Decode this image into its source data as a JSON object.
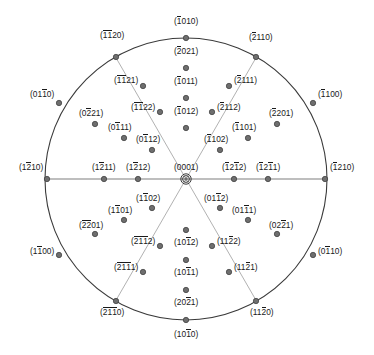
{
  "figure": {
    "type": "stereographic-projection",
    "lattice": "hexagonal",
    "notation": "Miller-Bravais (hkil)",
    "center": {
      "cx": 186,
      "cy": 179,
      "r": 141
    },
    "colors": {
      "background": "#ffffff",
      "circle_stroke": "#3a3a3a",
      "sector_stroke": "#a8a8a8",
      "axis_stroke": "#a8a8a8",
      "pole_fill": "#6e6e6e",
      "pole_stroke": "#3a3a3a",
      "label_text": "#1a1a1a"
    },
    "sector_angles_deg": [
      0,
      60,
      120,
      180,
      240,
      300
    ]
  },
  "poles": [
    {
      "name": "center-pole",
      "label": "(0001)",
      "bars": [],
      "x": 186,
      "y": 179,
      "lx": 186,
      "ly": 168,
      "anchor": "c",
      "marker": "double"
    },
    {
      "name": "pole-top",
      "label": "(1010)",
      "bars": [
        0
      ],
      "x": 186,
      "y": 38,
      "lx": 186,
      "ly": 22,
      "anchor": "c",
      "marker": "dot"
    },
    {
      "name": "pole-bottom",
      "label": "(1010)",
      "bars": [
        2
      ],
      "x": 186,
      "y": 320,
      "lx": 186,
      "ly": 335,
      "anchor": "c",
      "marker": "dot"
    },
    {
      "name": "pole-left",
      "label": "(1210)",
      "bars": [
        1
      ],
      "x": 47,
      "y": 179,
      "lx": 43,
      "ly": 168,
      "anchor": "r",
      "marker": "dot"
    },
    {
      "name": "pole-right",
      "label": "(1210)",
      "bars": [
        0
      ],
      "x": 325,
      "y": 179,
      "lx": 330,
      "ly": 168,
      "anchor": "l",
      "marker": "dot"
    },
    {
      "name": "pole-rim-ul",
      "label": "(1120)",
      "bars": [
        0,
        1
      ],
      "x": 116,
      "y": 57,
      "lx": 112,
      "ly": 36,
      "anchor": "c",
      "marker": "dot"
    },
    {
      "name": "pole-rim-ur",
      "label": "(2110)",
      "bars": [
        0
      ],
      "x": 256,
      "y": 57,
      "lx": 261,
      "ly": 38,
      "anchor": "c",
      "marker": "dot"
    },
    {
      "name": "pole-rim-ll",
      "label": "(2110)",
      "bars": [
        0,
        1,
        2
      ],
      "x": 116,
      "y": 301,
      "lx": 112,
      "ly": 313,
      "anchor": "c",
      "marker": "dot"
    },
    {
      "name": "pole-rim-lr",
      "label": "(1120)",
      "bars": [
        2
      ],
      "x": 256,
      "y": 301,
      "lx": 262,
      "ly": 313,
      "anchor": "c",
      "marker": "dot"
    },
    {
      "name": "pole-rim-wl-up",
      "label": "(0110)",
      "bars": [
        2
      ],
      "x": 59,
      "y": 103,
      "lx": 54,
      "ly": 95,
      "anchor": "r",
      "marker": "dot"
    },
    {
      "name": "pole-rim-wr-up",
      "label": "(1100)",
      "bars": [
        0
      ],
      "x": 313,
      "y": 103,
      "lx": 318,
      "ly": 95,
      "anchor": "l",
      "marker": "dot"
    },
    {
      "name": "pole-rim-wl-dn",
      "label": "(1100)",
      "bars": [
        1
      ],
      "x": 59,
      "y": 255,
      "lx": 54,
      "ly": 252,
      "anchor": "r",
      "marker": "dot"
    },
    {
      "name": "pole-rim-wr-dn",
      "label": "(0110)",
      "bars": [
        1
      ],
      "x": 313,
      "y": 255,
      "lx": 318,
      "ly": 252,
      "anchor": "l",
      "marker": "dot"
    },
    {
      "name": "pole-n-2021",
      "label": "(2021)",
      "bars": [
        0
      ],
      "x": 186,
      "y": 68,
      "lx": 186,
      "ly": 52,
      "anchor": "c",
      "marker": "dot"
    },
    {
      "name": "pole-n-1011",
      "label": "(1011)",
      "bars": [
        0
      ],
      "x": 186,
      "y": 98,
      "lx": 186,
      "ly": 82,
      "anchor": "c",
      "marker": "dot"
    },
    {
      "name": "pole-n-1012",
      "label": "(1012)",
      "bars": [
        0
      ],
      "x": 186,
      "y": 128,
      "lx": 186,
      "ly": 112,
      "anchor": "c",
      "marker": "dot"
    },
    {
      "name": "pole-s-1012",
      "label": "(1012)",
      "bars": [
        2
      ],
      "x": 186,
      "y": 230,
      "lx": 186,
      "ly": 243,
      "anchor": "c",
      "marker": "dot"
    },
    {
      "name": "pole-s-1011",
      "label": "(1011)",
      "bars": [
        2
      ],
      "x": 186,
      "y": 260,
      "lx": 186,
      "ly": 273,
      "anchor": "c",
      "marker": "dot"
    },
    {
      "name": "pole-s-2021",
      "label": "(2021)",
      "bars": [
        2
      ],
      "x": 186,
      "y": 290,
      "lx": 186,
      "ly": 303,
      "anchor": "c",
      "marker": "dot"
    },
    {
      "name": "pole-sect-ne-2111",
      "label": "(2111)",
      "bars": [
        0
      ],
      "x": 229,
      "y": 86,
      "lx": 234,
      "ly": 81,
      "anchor": "l",
      "marker": "dot"
    },
    {
      "name": "pole-sect-ne-2112",
      "label": "(2112)",
      "bars": [
        0
      ],
      "x": 212,
      "y": 112,
      "lx": 217,
      "ly": 108,
      "anchor": "l",
      "marker": "dot"
    },
    {
      "name": "pole-sect-nw-1121",
      "label": "(1121)",
      "bars": [
        0,
        1
      ],
      "x": 143,
      "y": 86,
      "lx": 138,
      "ly": 81,
      "anchor": "r",
      "marker": "dot"
    },
    {
      "name": "pole-sect-nw-1122",
      "label": "(1122)",
      "bars": [
        0,
        1
      ],
      "x": 160,
      "y": 112,
      "lx": 155,
      "ly": 108,
      "anchor": "r",
      "marker": "dot"
    },
    {
      "name": "pole-sect-se-1121",
      "label": "(1121)",
      "bars": [
        2
      ],
      "x": 229,
      "y": 272,
      "lx": 234,
      "ly": 268,
      "anchor": "l",
      "marker": "dot"
    },
    {
      "name": "pole-sect-se-1122",
      "label": "(1122)",
      "bars": [
        2
      ],
      "x": 212,
      "y": 246,
      "lx": 217,
      "ly": 242,
      "anchor": "l",
      "marker": "dot"
    },
    {
      "name": "pole-sect-sw-2111",
      "label": "(2111)",
      "bars": [
        0,
        1,
        2
      ],
      "x": 143,
      "y": 272,
      "lx": 138,
      "ly": 268,
      "anchor": "r",
      "marker": "dot"
    },
    {
      "name": "pole-sect-sw-2112",
      "label": "(2112)",
      "bars": [
        0,
        1,
        2
      ],
      "x": 160,
      "y": 246,
      "lx": 155,
      "ly": 242,
      "anchor": "r",
      "marker": "dot"
    },
    {
      "name": "pole-eq-l-1211",
      "label": "(1211)",
      "bars": [
        1
      ],
      "x": 104,
      "y": 179,
      "lx": 104,
      "ly": 168,
      "anchor": "c",
      "marker": "dot"
    },
    {
      "name": "pole-eq-l-1212",
      "label": "(1212)",
      "bars": [
        1
      ],
      "x": 138,
      "y": 179,
      "lx": 138,
      "ly": 168,
      "anchor": "c",
      "marker": "dot"
    },
    {
      "name": "pole-eq-r-1212",
      "label": "(1212)",
      "bars": [
        0,
        2
      ],
      "x": 234,
      "y": 179,
      "lx": 234,
      "ly": 168,
      "anchor": "c",
      "marker": "dot"
    },
    {
      "name": "pole-eq-r-1211",
      "label": "(1211)",
      "bars": [
        0,
        2
      ],
      "x": 268,
      "y": 179,
      "lx": 268,
      "ly": 168,
      "anchor": "c",
      "marker": "dot"
    },
    {
      "name": "pole-nw-0221",
      "label": "(0221)",
      "bars": [
        1
      ],
      "x": 95,
      "y": 124,
      "lx": 91,
      "ly": 114,
      "anchor": "c",
      "marker": "dot"
    },
    {
      "name": "pole-nw-0111",
      "label": "(0111)",
      "bars": [
        1
      ],
      "x": 124,
      "y": 138,
      "lx": 120,
      "ly": 128,
      "anchor": "c",
      "marker": "dot"
    },
    {
      "name": "pole-nw-0112",
      "label": "(0112)",
      "bars": [
        1
      ],
      "x": 152,
      "y": 150,
      "lx": 148,
      "ly": 140,
      "anchor": "c",
      "marker": "dot"
    },
    {
      "name": "pole-ne-2201",
      "label": "(2201)",
      "bars": [
        0
      ],
      "x": 277,
      "y": 124,
      "lx": 281,
      "ly": 114,
      "anchor": "c",
      "marker": "dot"
    },
    {
      "name": "pole-ne-1101",
      "label": "(1101)",
      "bars": [
        0
      ],
      "x": 248,
      "y": 138,
      "lx": 244,
      "ly": 128,
      "anchor": "c",
      "marker": "dot"
    },
    {
      "name": "pole-ne-1102",
      "label": "(1102)",
      "bars": [
        0
      ],
      "x": 220,
      "y": 150,
      "lx": 216,
      "ly": 140,
      "anchor": "c",
      "marker": "dot"
    },
    {
      "name": "pole-sw-2201",
      "label": "(2201)",
      "bars": [
        0,
        1
      ],
      "x": 95,
      "y": 234,
      "lx": 91,
      "ly": 226,
      "anchor": "c",
      "marker": "dot"
    },
    {
      "name": "pole-sw-1101",
      "label": "(1101)",
      "bars": [
        1
      ],
      "x": 124,
      "y": 220,
      "lx": 120,
      "ly": 211,
      "anchor": "c",
      "marker": "dot"
    },
    {
      "name": "pole-sw-1102",
      "label": "(1102)",
      "bars": [
        1
      ],
      "x": 152,
      "y": 208,
      "lx": 148,
      "ly": 199,
      "anchor": "c",
      "marker": "dot"
    },
    {
      "name": "pole-se-0221",
      "label": "(0221)",
      "bars": [
        2
      ],
      "x": 277,
      "y": 234,
      "lx": 281,
      "ly": 226,
      "anchor": "c",
      "marker": "dot"
    },
    {
      "name": "pole-se-0111",
      "label": "(0111)",
      "bars": [
        2
      ],
      "x": 248,
      "y": 220,
      "lx": 244,
      "ly": 211,
      "anchor": "c",
      "marker": "dot"
    },
    {
      "name": "pole-se-0112",
      "label": "(0112)",
      "bars": [
        2
      ],
      "x": 220,
      "y": 208,
      "lx": 216,
      "ly": 199,
      "anchor": "c",
      "marker": "dot"
    }
  ]
}
